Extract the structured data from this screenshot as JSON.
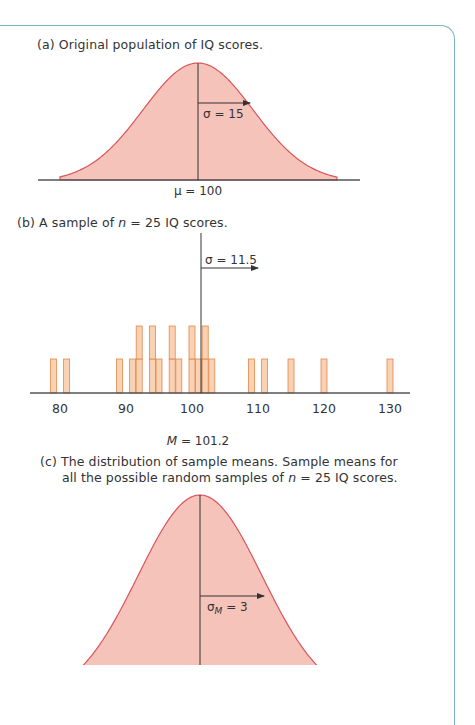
{
  "colors": {
    "frame": "#7fb2c2",
    "curve_fill": "#f6c3bb",
    "curve_stroke": "#d9545a",
    "bar_fill": "#f8c9a6",
    "bar_stroke": "#e0884f",
    "axis": "#555555",
    "text": "#333333"
  },
  "panels": {
    "a": {
      "caption_prefix": "(a) Original population of IQ scores.",
      "sigma_label": "σ = 15",
      "mean_label": "μ = 100"
    },
    "b": {
      "caption_pre": "(b) A sample of ",
      "caption_n": "n",
      "caption_post": " = 25 IQ scores.",
      "sigma_label": "σ = 11.5",
      "mean_label_var": "M",
      "mean_label_val": " = 101.2",
      "ticks": [
        "80",
        "90",
        "100",
        "110",
        "120",
        "130"
      ]
    },
    "c": {
      "caption_line1": "(c) The distribution of sample means. Sample means for",
      "caption_line2_pre": "all the possible random samples of ",
      "caption_line2_n": "n",
      "caption_line2_post": " = 25 IQ scores.",
      "sigma_label_base": "σ",
      "sigma_label_sub": "M",
      "sigma_label_val": " = 3"
    }
  },
  "chart_data": [
    {
      "type": "area",
      "title": "(a) Original population of IQ scores.",
      "distribution": "normal",
      "mean": 100,
      "sd": 15,
      "annotations": [
        "σ = 15",
        "μ = 100"
      ]
    },
    {
      "type": "bar",
      "title": "(b) A sample of n = 25 IQ scores.",
      "xlabel": "",
      "x_ticks": [
        80,
        90,
        100,
        110,
        120,
        130
      ],
      "xlim": [
        75,
        133
      ],
      "sample_size": 25,
      "sample_mean": 101.2,
      "sample_sd": 11.5,
      "bars": [
        {
          "x": 79,
          "count": 1
        },
        {
          "x": 81,
          "count": 1
        },
        {
          "x": 89,
          "count": 1
        },
        {
          "x": 91,
          "count": 1
        },
        {
          "x": 92,
          "count": 2
        },
        {
          "x": 94,
          "count": 2
        },
        {
          "x": 95,
          "count": 1
        },
        {
          "x": 97,
          "count": 2
        },
        {
          "x": 98,
          "count": 1
        },
        {
          "x": 100,
          "count": 2
        },
        {
          "x": 101,
          "count": 1
        },
        {
          "x": 102,
          "count": 2
        },
        {
          "x": 103,
          "count": 1
        },
        {
          "x": 109,
          "count": 1
        },
        {
          "x": 111,
          "count": 1
        },
        {
          "x": 115,
          "count": 1
        },
        {
          "x": 120,
          "count": 1
        },
        {
          "x": 130,
          "count": 1
        }
      ],
      "annotations": [
        "σ = 11.5",
        "M = 101.2"
      ]
    },
    {
      "type": "area",
      "title": "(c) The distribution of sample means. Sample means for all the possible random samples of n = 25 IQ scores.",
      "distribution": "normal",
      "mean": 100,
      "sd": 3,
      "annotations": [
        "σM = 3"
      ]
    }
  ]
}
